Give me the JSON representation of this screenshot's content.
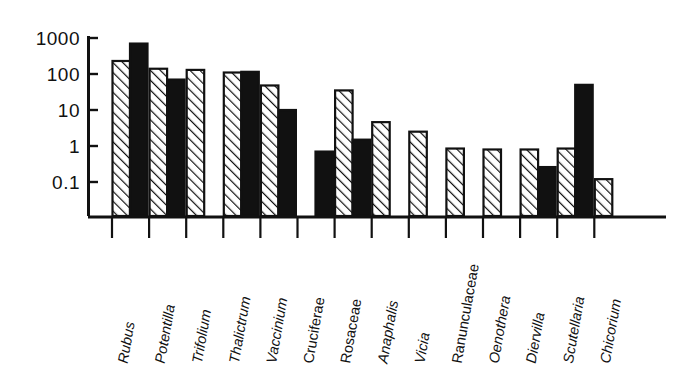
{
  "chart_data": {
    "type": "bar",
    "title": "",
    "subtitle": "",
    "xlabel": "",
    "ylabel": "",
    "yscale": "log",
    "ylim": [
      0.04,
      1000
    ],
    "grid": false,
    "legend_position": "none",
    "yticks": [
      1000,
      100,
      10,
      1,
      0.1
    ],
    "ytick_labels": [
      "1000",
      "100",
      "10",
      "1",
      "0.1"
    ],
    "categories": [
      "Rubus",
      "Potentilla",
      "Trifolium",
      "Thalictrum",
      "Vaccinium",
      "Cruciferae",
      "Rosaceae",
      "Anaphalis",
      "Vicia",
      "Ranunculaceae",
      "Oenothera",
      "Diervilla",
      "Scutellaria",
      "Chicorium"
    ],
    "category_styles": [
      "italic",
      "italic",
      "italic",
      "italic",
      "italic",
      "roman",
      "roman",
      "italic",
      "italic",
      "roman",
      "italic",
      "italic",
      "italic",
      "italic"
    ],
    "series": [
      {
        "name": "hatched",
        "fill": "hatch",
        "values": [
          230,
          140,
          130,
          110,
          48,
          0,
          35,
          4.6,
          2.5,
          0.85,
          0.8,
          0.8,
          0.85,
          0.12
        ]
      },
      {
        "name": "solid",
        "fill": "black",
        "values": [
          700,
          70,
          0,
          115,
          10,
          0.7,
          1.5,
          0,
          0,
          0,
          0,
          0.26,
          50,
          0
        ]
      }
    ]
  },
  "axis": {
    "ytick_fontsize": 19,
    "axis_color": "#111111"
  },
  "icons": {
    "hatch_pattern": "diagonal-hatch-icon",
    "solid_pattern": "solid-black-icon"
  }
}
